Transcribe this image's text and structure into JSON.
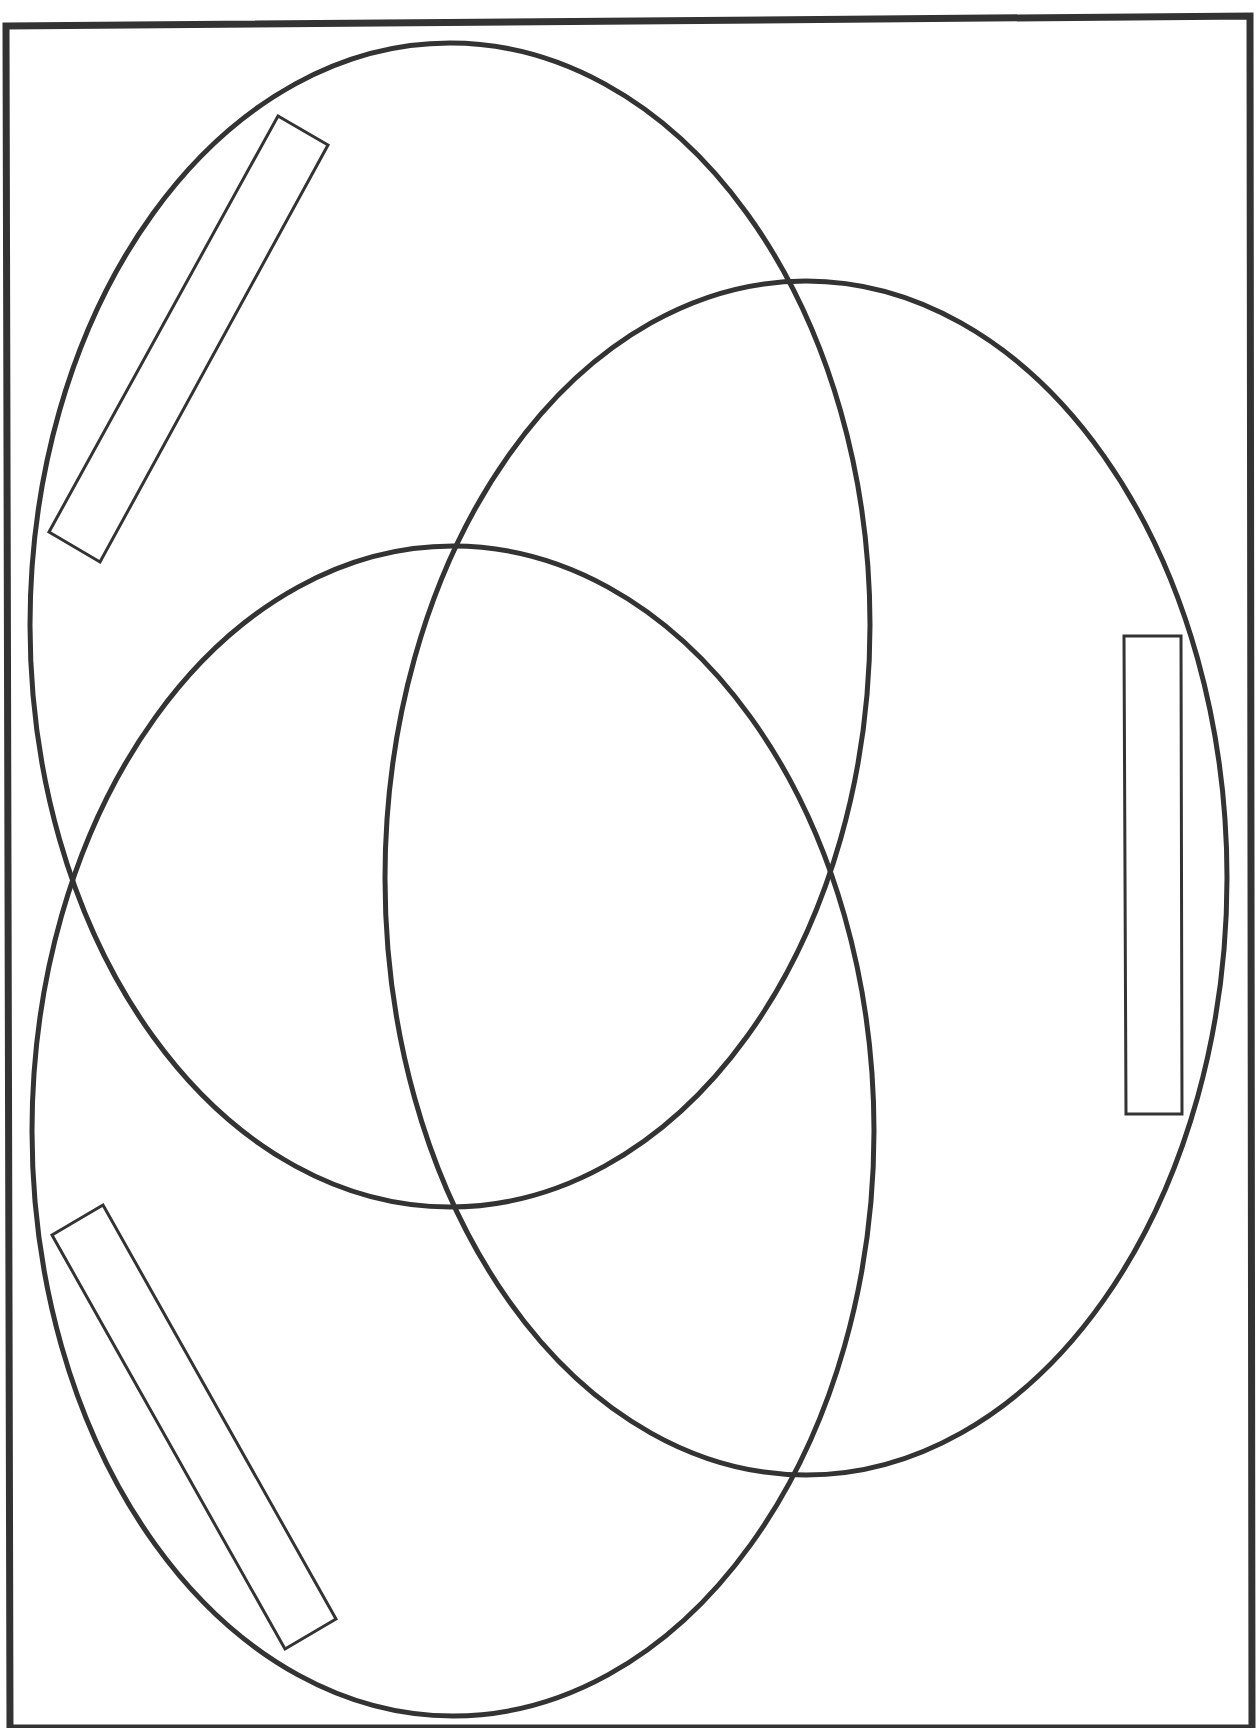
{
  "diagram": {
    "type": "venn-3",
    "stroke_color": "#333333",
    "background": "#ffffff",
    "frame": {
      "points": "6,26 1250,16 1252,1728 10,1728"
    },
    "circles": [
      {
        "name": "circle-top-left",
        "cx": 450,
        "cy": 625,
        "rx": 420,
        "ry": 582
      },
      {
        "name": "circle-bottom-left",
        "cx": 453,
        "cy": 1131,
        "rx": 421,
        "ry": 585
      },
      {
        "name": "circle-right",
        "cx": 806,
        "cy": 878,
        "rx": 421,
        "ry": 597
      }
    ],
    "label_boxes": [
      {
        "name": "label-box-top-left",
        "points": "278,116 328,145 100,562 49,532",
        "text": ""
      },
      {
        "name": "label-box-right",
        "points": "1124,636 1181,636 1182,1114 1126,1114",
        "text": ""
      },
      {
        "name": "label-box-bottom-left",
        "points": "52,1235 103,1205 336,1619 285,1649",
        "text": ""
      }
    ]
  }
}
